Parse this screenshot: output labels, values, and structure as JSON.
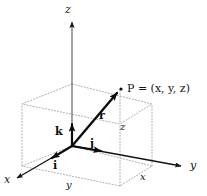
{
  "figure": {
    "kind": "3d-cartesian-coordinate-diagram",
    "background_color": "#ffffff",
    "ink_color": "#141414",
    "dotted_color": "#9a9a9a"
  },
  "axes": {
    "z_label": "z",
    "y_label": "y",
    "x_label": "x"
  },
  "point": {
    "label": "P = (x, y, z)"
  },
  "dimensions": {
    "z_label": "z",
    "y_label": "y",
    "x_label": "x"
  },
  "vectors": {
    "position_label": "r",
    "unit_k_label": "k",
    "unit_j_label": "j",
    "unit_i_label": "i"
  },
  "geometry": {
    "origin": [
      72,
      146
    ],
    "z_axis_tip": [
      72,
      18
    ],
    "y_axis_tip": [
      186,
      167
    ],
    "x_axis_tip": [
      12,
      180
    ],
    "point_P": [
      120,
      90
    ],
    "box_front_bottom_left": [
      22,
      166
    ],
    "box_front_bottom_right": [
      120,
      186
    ],
    "box_back_bottom_right": [
      152,
      166
    ],
    "box_top_height": 62
  }
}
